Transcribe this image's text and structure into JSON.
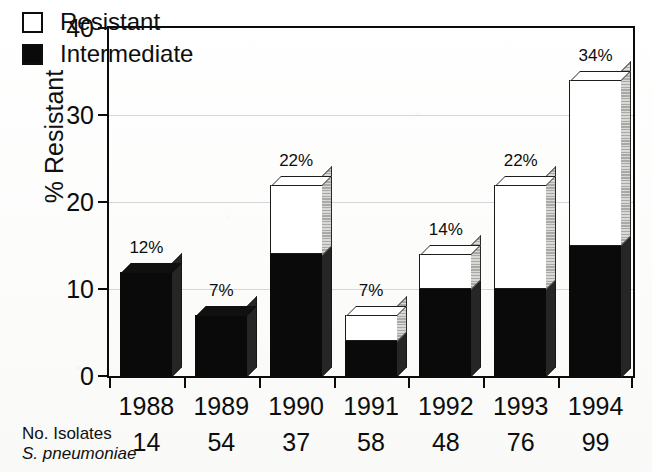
{
  "chart_data": {
    "type": "bar",
    "title": "",
    "subtitle": "",
    "xlabel": "",
    "ylabel": "% Resistant",
    "ylim": [
      0,
      40
    ],
    "yticks": [
      0,
      10,
      20,
      30,
      40
    ],
    "ytick_labels": [
      "0",
      "10",
      "20",
      "30",
      "40"
    ],
    "grid": true,
    "stacked": true,
    "legend_position": "inside-top-left",
    "categories": [
      "1988",
      "1989",
      "1990",
      "1991",
      "1992",
      "1993",
      "1994"
    ],
    "series": [
      {
        "name": "Intermediate",
        "color": "#0a0a0a",
        "values": [
          12,
          7,
          14,
          4,
          10,
          10,
          15
        ]
      },
      {
        "name": "Resistant",
        "color": "#ffffff",
        "values": [
          0,
          0,
          8,
          3,
          4,
          12,
          19
        ]
      }
    ],
    "totals": [
      12,
      7,
      22,
      7,
      14,
      22,
      34
    ],
    "bar_labels": [
      "12%",
      "7%",
      "22%",
      "7%",
      "14%",
      "22%",
      "34%"
    ],
    "annotations": {
      "row_label_line1": "No. Isolates",
      "row_label_line2": "S. pneumoniae",
      "row_values": [
        "14",
        "54",
        "37",
        "58",
        "48",
        "76",
        "99"
      ]
    }
  },
  "legend": {
    "items": [
      {
        "label": "Resistant",
        "swatch": "hollow"
      },
      {
        "label": "Intermediate",
        "swatch": "filled"
      }
    ]
  }
}
